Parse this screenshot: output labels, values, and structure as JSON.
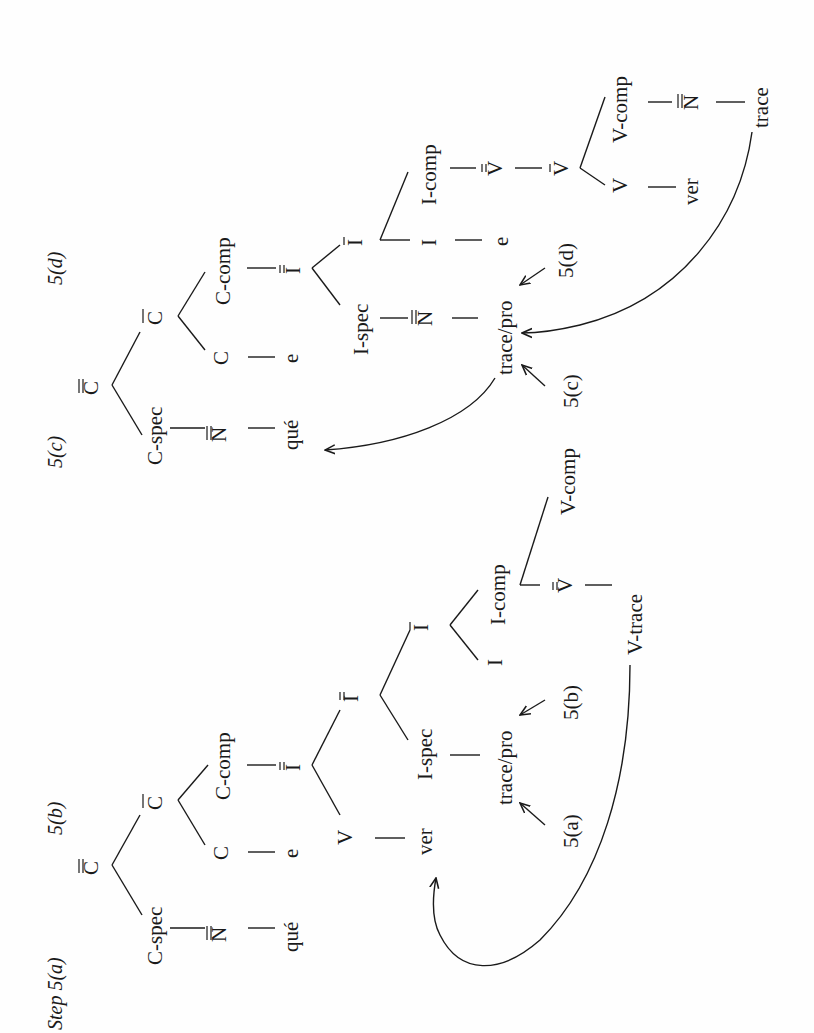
{
  "page": {
    "orientation": "rotated-90-ccw",
    "description_visible": "Two syntactic movement trees"
  },
  "tree_ab": {
    "step_label": "Step 5(a)",
    "step_label_b": "5(b)",
    "root": "C",
    "root_bars": 2,
    "c_spec": "C-spec",
    "c_spec_child": "N",
    "c_spec_child_bars": 2,
    "c_spec_word": "qué",
    "c_bar": "C",
    "c_bar_bars": 1,
    "c_head": "C",
    "c_head_word": "e",
    "c_comp": "C-comp",
    "c_comp_child": "I",
    "c_comp_child_bars": 2,
    "v_adjoined": "V",
    "v_adjoined_word": "ver",
    "i_dbl": "I",
    "i_dbl_bars": 2,
    "i_spec": "I-spec",
    "i_spec_word": "trace/pro",
    "i_bar": "I",
    "i_bar_bars": 1,
    "i_head": "I",
    "i_comp": "I-comp",
    "v_dbl": "V",
    "v_dbl_bars": 2,
    "v_trace": "V-trace",
    "v_comp": "V-comp",
    "arrow_label_a": "5(a)",
    "arrow_label_b": "5(b)"
  },
  "tree_cd": {
    "step_label_c": "5(c)",
    "step_label_d": "5(d)",
    "root": "C",
    "root_bars": 2,
    "c_spec": "C-spec",
    "c_spec_child": "N",
    "c_spec_child_bars": 2,
    "c_spec_word": "qué",
    "c_bar": "C",
    "c_bar_bars": 1,
    "c_head": "C",
    "c_head_word": "e",
    "c_comp": "C-comp",
    "c_comp_child": "I",
    "c_comp_child_bars": 2,
    "i_spec": "I-spec",
    "i_spec_child": "N",
    "i_spec_child_bars": 2,
    "i_spec_word": "trace/pro",
    "i_bar": "I",
    "i_bar_bars": 1,
    "i_head": "I",
    "i_head_word": "e",
    "i_comp": "I-comp",
    "v_dbl": "V",
    "v_dbl_bars": 2,
    "v_bar": "V",
    "v_bar_bars": 1,
    "v_head": "V",
    "v_head_word": "ver",
    "v_comp": "V-comp",
    "v_comp_child": "N",
    "v_comp_child_bars": 2,
    "v_comp_word": "trace",
    "arrow_label_c": "5(c)",
    "arrow_label_d": "5(d)"
  },
  "colors": {
    "ink": "#1a1a1a",
    "paper": "#fefefe"
  }
}
